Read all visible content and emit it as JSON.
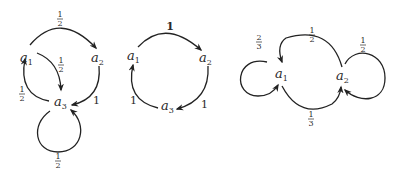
{
  "diagrams": [
    {
      "id": "graph-1",
      "nodes": [
        {
          "name": "a",
          "sub": "1"
        },
        {
          "name": "a",
          "sub": "2"
        },
        {
          "name": "a",
          "sub": "3"
        }
      ],
      "edges": [
        {
          "from": "a1",
          "to": "a2",
          "num": "1",
          "den": "2"
        },
        {
          "from": "a1",
          "to": "a3",
          "num": "1",
          "den": "2"
        },
        {
          "from": "a2",
          "to": "a3",
          "label": "1"
        },
        {
          "from": "a3",
          "to": "a1",
          "num": "1",
          "den": "2"
        },
        {
          "from": "a3",
          "to": "a3",
          "num": "1",
          "den": "2"
        }
      ]
    },
    {
      "id": "graph-2",
      "nodes": [
        {
          "name": "a",
          "sub": "1"
        },
        {
          "name": "a",
          "sub": "2"
        },
        {
          "name": "a",
          "sub": "3"
        }
      ],
      "edges": [
        {
          "from": "a1",
          "to": "a2",
          "label": "1"
        },
        {
          "from": "a2",
          "to": "a3",
          "label": "1"
        },
        {
          "from": "a3",
          "to": "a1",
          "label": "1"
        }
      ]
    },
    {
      "id": "graph-3",
      "nodes": [
        {
          "name": "a",
          "sub": "1"
        },
        {
          "name": "a",
          "sub": "2"
        }
      ],
      "edges": [
        {
          "from": "a1",
          "to": "a1",
          "num": "2",
          "den": "3"
        },
        {
          "from": "a2",
          "to": "a1",
          "num": "1",
          "den": "2"
        },
        {
          "from": "a1",
          "to": "a2",
          "num": "1",
          "den": "3"
        },
        {
          "from": "a2",
          "to": "a2",
          "num": "1",
          "den": "2"
        }
      ]
    }
  ]
}
